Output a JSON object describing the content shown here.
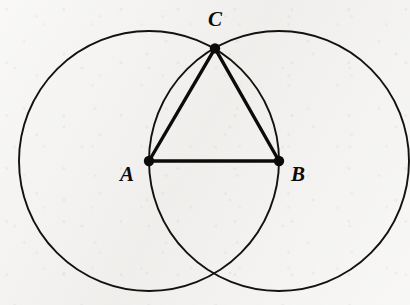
{
  "figure": {
    "background_color": "#f1f0ee",
    "ink_color": "#0d0b0a",
    "width": 410,
    "height": 305
  },
  "labels": {
    "a": "A",
    "b": "B",
    "c": "C"
  },
  "label_positions": {
    "a": {
      "x": 127,
      "y": 176
    },
    "b": {
      "x": 298,
      "y": 176
    },
    "c": {
      "x": 215,
      "y": 21
    }
  },
  "chart_data": {
    "type": "scatter",
    "xlabel": "",
    "ylabel": "",
    "grid": false,
    "legend": null,
    "xlim": [
      0,
      410
    ],
    "ylim": [
      305,
      0
    ],
    "points": [
      {
        "name": "A",
        "label": "A",
        "x": 149,
        "y": 161,
        "dot_radius": 5.2,
        "label_dx": -22,
        "label_dy": 15
      },
      {
        "name": "B",
        "label": "B",
        "x": 279,
        "y": 161,
        "dot_radius": 5.2,
        "label_dx": 19,
        "label_dy": 15
      },
      {
        "name": "C",
        "label": "C",
        "x": 215,
        "y": 48.4,
        "dot_radius": 5.2,
        "label_dx": 0,
        "label_dy": -27
      }
    ],
    "circles": [
      {
        "name": "circle-centered-at-A",
        "cx": 149,
        "cy": 161,
        "r": 130,
        "stroke_width": 1.9
      },
      {
        "name": "circle-centered-at-B",
        "cx": 279,
        "cy": 161,
        "r": 130,
        "stroke_width": 1.9
      }
    ],
    "segments": [
      {
        "name": "segment-AB",
        "x1": 149,
        "y1": 161,
        "x2": 279,
        "y2": 161,
        "stroke_width": 3.4,
        "length": 130
      },
      {
        "name": "segment-AC",
        "x1": 149,
        "y1": 161,
        "x2": 215,
        "y2": 48.4,
        "stroke_width": 3.4,
        "length": 130
      },
      {
        "name": "segment-BC",
        "x1": 279,
        "y1": 161,
        "x2": 215,
        "y2": 48.4,
        "stroke_width": 3.4,
        "length": 130
      }
    ],
    "intersections": [
      {
        "name": "upper-intersection",
        "x": 215,
        "y": 48.4,
        "marked": true
      },
      {
        "name": "lower-intersection",
        "x": 214,
        "y": 277,
        "marked": false
      }
    ]
  }
}
